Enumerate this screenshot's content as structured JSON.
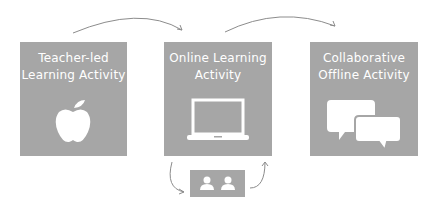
{
  "diagram": {
    "nodes": [
      {
        "id": "teacher-led",
        "label": "Teacher-led Learning Activity",
        "icon": "apple-icon"
      },
      {
        "id": "online",
        "label": "Online Learning Activity",
        "icon": "laptop-icon"
      },
      {
        "id": "collaborative",
        "label": "Collaborative Offline Activity",
        "icon": "speech-bubbles-icon"
      },
      {
        "id": "peers",
        "label": "",
        "icon": "two-people-icon"
      }
    ],
    "edges": [
      {
        "from": "teacher-led",
        "to": "online"
      },
      {
        "from": "online",
        "to": "collaborative"
      },
      {
        "from": "online",
        "to": "peers"
      },
      {
        "from": "peers",
        "to": "online"
      }
    ],
    "colors": {
      "box": "#a6a6a6",
      "arrow": "#8c8c8c",
      "icon": "#ffffff"
    }
  }
}
